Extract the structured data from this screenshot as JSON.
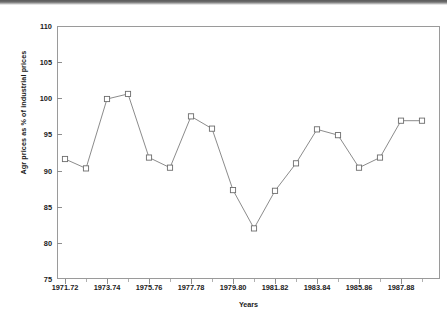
{
  "chart_data": {
    "type": "line",
    "title": "",
    "xlabel": "Years",
    "ylabel": "Agr prices as % of industrial prices",
    "ylim": [
      75,
      110
    ],
    "ytick_values": [
      75,
      80,
      85,
      90,
      95,
      100,
      105,
      110
    ],
    "ytick_labels": [
      "75",
      "80",
      "85",
      "90",
      "95",
      "100",
      "105",
      "110"
    ],
    "grid": false,
    "legend": "none",
    "marker": "open-square",
    "line_color": "#6d6d6d",
    "marker_face_color": "#ffffff",
    "xtick_labels": [
      "1971.72",
      "1973.74",
      "1975.76",
      "1977.78",
      "1979.80",
      "1981.82",
      "1983.84",
      "1985.86",
      "1987.88"
    ],
    "x": [
      "1971.72",
      "1972.73",
      "1973.74",
      "1974.75",
      "1975.76",
      "1976.77",
      "1977.78",
      "1978.79",
      "1979.80",
      "1980.81",
      "1981.82",
      "1982.83",
      "1983.84",
      "1984.85",
      "1985.86",
      "1986.87",
      "1987.88",
      "1988.89"
    ],
    "values": [
      91.6,
      90.3,
      99.9,
      100.6,
      91.8,
      90.4,
      97.5,
      95.8,
      87.3,
      82.0,
      87.2,
      91.0,
      95.7,
      94.9,
      90.4,
      91.8,
      96.9,
      96.9
    ]
  }
}
